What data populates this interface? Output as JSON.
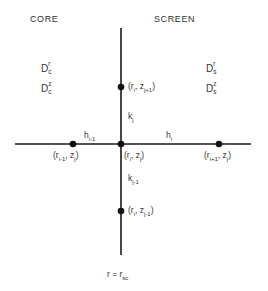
{
  "regions": {
    "left_label": "CORE",
    "right_label": "SCREEN"
  },
  "diffusion_coefficients": {
    "core": [
      {
        "base": "D",
        "sup": "r",
        "sub": "c"
      },
      {
        "base": "D",
        "sup": "z",
        "sub": "c"
      }
    ],
    "screen": [
      {
        "base": "D",
        "sup": "r",
        "sub": "s"
      },
      {
        "base": "D",
        "sup": "z",
        "sub": "s"
      }
    ]
  },
  "nodes": {
    "center": {
      "text": "(r",
      "r_sub": "i",
      "mid": ", z",
      "z_sub": "j",
      "end": ")"
    },
    "top": {
      "text": "(r",
      "r_sub": "i",
      "mid": ", z",
      "z_sub": "j+1",
      "end": ")"
    },
    "bottom": {
      "text": "(r",
      "r_sub": "i",
      "mid": ", z",
      "z_sub": "j-1",
      "end": ")"
    },
    "left": {
      "text": "(r",
      "r_sub": "i-1",
      "mid": ", z",
      "z_sub": "j",
      "end": ")"
    },
    "right": {
      "text": "(r",
      "r_sub": "i+1",
      "mid": ", z",
      "z_sub": "j",
      "end": ")"
    }
  },
  "spacings": {
    "h_left": {
      "base": "h",
      "sub": "i-1"
    },
    "h_right": {
      "base": "h",
      "sub": "i"
    },
    "k_up": {
      "base": "k",
      "sub": "j"
    },
    "k_down": {
      "base": "k",
      "sub": "j-1"
    }
  },
  "interface": {
    "base": "r = r",
    "sub": "sc"
  },
  "colors": {
    "line": "#1a1a1a",
    "text": "#333333",
    "background": "#ffffff"
  }
}
